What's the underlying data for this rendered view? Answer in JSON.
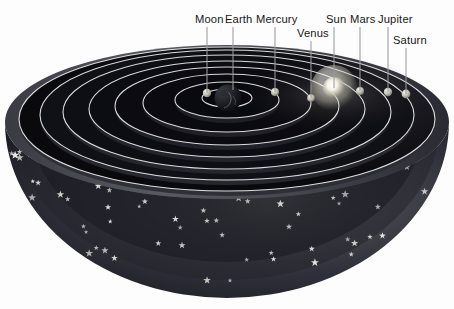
{
  "figure": {
    "background_color": "#fdfdfd",
    "label_color": "#171717",
    "pointer_color": "#8f8f8f",
    "orbit_ring_color": "#e8e8e8",
    "bowl_dark_color": "#0d0d12",
    "bowl_mid_color": "#2c2c33",
    "bowl_rim_color": "#55555d",
    "star_color": "#e6e6e2",
    "sun_color": "#f2f0e4"
  },
  "labels": [
    {
      "id": "moon",
      "text": "Moon",
      "text_x": 195,
      "text_y": 23,
      "anchor": "start",
      "line_x1": 207,
      "line_y1": 27,
      "line_x2": 207,
      "line_y2": 93
    },
    {
      "id": "earth",
      "text": "Earth",
      "text_x": 225,
      "text_y": 23,
      "anchor": "start",
      "line_x1": 233,
      "line_y1": 27,
      "line_x2": 233,
      "line_y2": 90
    },
    {
      "id": "mercury",
      "text": "Mercury",
      "text_x": 256,
      "text_y": 23,
      "anchor": "start",
      "line_x1": 275,
      "line_y1": 27,
      "line_x2": 275,
      "line_y2": 92
    },
    {
      "id": "venus",
      "text": "Venus",
      "text_x": 297,
      "text_y": 37,
      "anchor": "start",
      "line_x1": 311,
      "line_y1": 41,
      "line_x2": 311,
      "line_y2": 98
    },
    {
      "id": "sun",
      "text": "Sun",
      "text_x": 326,
      "text_y": 23,
      "anchor": "start",
      "line_x1": 334,
      "line_y1": 27,
      "line_x2": 334,
      "line_y2": 88
    },
    {
      "id": "mars",
      "text": "Mars",
      "text_x": 350,
      "text_y": 23,
      "anchor": "start",
      "line_x1": 360,
      "line_y1": 27,
      "line_x2": 360,
      "line_y2": 91
    },
    {
      "id": "jupiter",
      "text": "Jupiter",
      "text_x": 378,
      "text_y": 23,
      "anchor": "start",
      "line_x1": 388,
      "line_y1": 27,
      "line_x2": 388,
      "line_y2": 92
    },
    {
      "id": "saturn",
      "text": "Saturn",
      "text_x": 393,
      "text_y": 44,
      "anchor": "start",
      "line_x1": 406,
      "line_y1": 48,
      "line_x2": 406,
      "line_y2": 94
    }
  ],
  "bodies": [
    {
      "id": "earth",
      "name": "Earth",
      "cx": 228,
      "cy": 98,
      "r": 13.5,
      "kind": "globe"
    },
    {
      "id": "moon",
      "name": "Moon",
      "cx": 207,
      "cy": 93,
      "r": 4.2,
      "kind": "small"
    },
    {
      "id": "mercury",
      "name": "Mercury",
      "cx": 275,
      "cy": 92,
      "r": 4.0,
      "kind": "small"
    },
    {
      "id": "venus",
      "name": "Venus",
      "cx": 311,
      "cy": 98,
      "r": 3.8,
      "kind": "small"
    },
    {
      "id": "sun",
      "name": "Sun",
      "cx": 334,
      "cy": 88,
      "r": 11.0,
      "kind": "sun"
    },
    {
      "id": "mars",
      "name": "Mars",
      "cx": 360,
      "cy": 91,
      "r": 4.0,
      "kind": "small"
    },
    {
      "id": "jupiter",
      "name": "Jupiter",
      "cx": 388,
      "cy": 92,
      "r": 4.2,
      "kind": "small"
    },
    {
      "id": "saturn",
      "name": "Saturn",
      "cx": 406,
      "cy": 94,
      "r": 4.4,
      "kind": "small"
    }
  ],
  "orbits": [
    {
      "id": "orbit-moon",
      "rx": 25,
      "ry": 9,
      "cy": 98
    },
    {
      "id": "orbit-mercury",
      "rx": 52,
      "ry": 18,
      "cy": 100
    },
    {
      "id": "orbit-venus",
      "rx": 84,
      "ry": 29,
      "cy": 103
    },
    {
      "id": "orbit-sun",
      "rx": 112,
      "ry": 39,
      "cy": 106
    },
    {
      "id": "orbit-mars",
      "rx": 138,
      "ry": 48,
      "cy": 109
    },
    {
      "id": "orbit-jupiter",
      "rx": 164,
      "ry": 57,
      "cy": 112
    },
    {
      "id": "orbit-saturn",
      "rx": 187,
      "ry": 65,
      "cy": 115
    },
    {
      "id": "orbit-outer",
      "rx": 208,
      "ry": 72,
      "cy": 119
    }
  ],
  "bowl": {
    "center_x": 227,
    "rim_cy": 122,
    "rim_rx": 222,
    "rim_ry": 77,
    "bottom_y": 296
  },
  "stars": {
    "count": 96,
    "glyph": "five-point-star"
  }
}
